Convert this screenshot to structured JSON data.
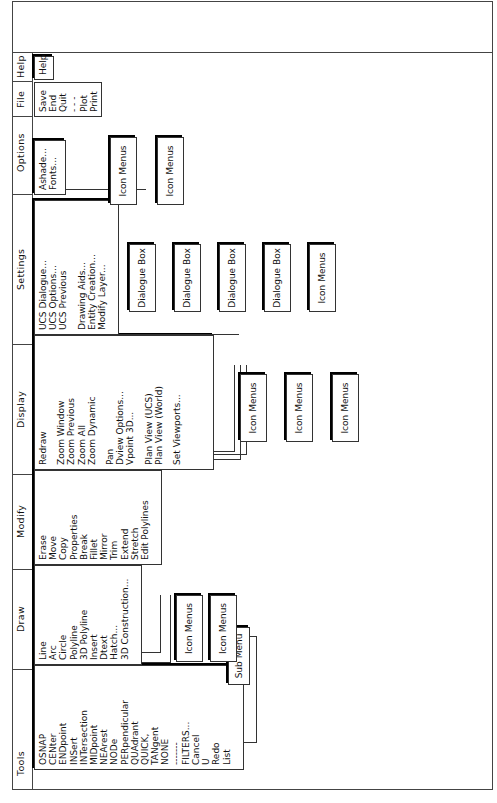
{
  "menubar": [
    {
      "label": "Tools",
      "items": [
        "OSNAP",
        "CENter",
        "ENDpoint",
        "INSert",
        "INTersection",
        "MIDpoint",
        "NEArest",
        "NODe",
        "PERpendicular",
        "QUAdrant",
        "QUICK,",
        "TANgent",
        "NONE",
        "-------",
        "FILTERS...",
        "Cancel",
        "U",
        "Redo",
        "List"
      ]
    },
    {
      "label": "Draw",
      "items": [
        "Line",
        "Arc",
        "Circle",
        "Polyline",
        "3D Polyline",
        "Insert",
        "Dtext",
        "Hatch...",
        "3D Construction..."
      ]
    },
    {
      "label": "Modify",
      "items": [
        "Erase",
        "Move",
        "Copy",
        "Properties",
        "Break",
        "Fillet",
        "Mirror",
        "Trim",
        "Extend",
        "Stretch",
        "Edit Polylines"
      ]
    },
    {
      "label": "Display",
      "items": [
        "Redraw",
        "",
        "Zoom  Window",
        "Zoom  Previous",
        "Zoom  All",
        "Zoom  Dynamic",
        "",
        "Pan",
        "Dview  Options...",
        "Vpoint  3D...",
        "",
        "Plan  View  (UCS)",
        "Plan  View  (World)",
        "",
        "Set  Viewports..."
      ]
    },
    {
      "label": "Settings",
      "items": [
        "UCS  Dialogue...",
        "UCS  Options...",
        "UCS  Previous",
        "",
        "Drawing  Aids...",
        "Entity  Creation...",
        "Modify  Layer..."
      ]
    },
    {
      "label": "Options",
      "items": [
        "Ashade...",
        "Fonts..."
      ]
    },
    {
      "label": "File",
      "items": [
        "Save",
        "End",
        "Quit",
        "- - -",
        "Plot",
        "Print"
      ]
    },
    {
      "label": "Help",
      "items": [
        "Help"
      ]
    }
  ],
  "submenus": {
    "tools": [
      "Sub  Menu"
    ],
    "draw": [
      "Icon  Menus",
      "Icon  Menus"
    ],
    "display": [
      "Icon  Menus",
      "Icon  Menus",
      "Icon  Menus"
    ],
    "settings": [
      "Dialogue  Box",
      "Dialogue  Box",
      "Dialogue  Box",
      "Dialogue  Box",
      "Icon  Menus"
    ],
    "options": [
      "Icon  Menus",
      "Icon  Menus"
    ]
  }
}
